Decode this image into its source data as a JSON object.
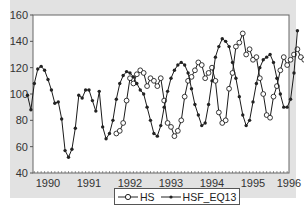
{
  "chart_data": {
    "type": "line",
    "title": "",
    "xlabel": "",
    "ylabel": "",
    "ylim": [
      40,
      160
    ],
    "yticks": [
      40,
      60,
      80,
      100,
      120,
      140,
      160
    ],
    "xticks": [
      "1990",
      "1991",
      "1992",
      "1993",
      "1994",
      "1995",
      "1996"
    ],
    "x_start": "1989-07",
    "frequency": "monthly",
    "grid": false,
    "legend_position": "bottom",
    "series": [
      {
        "name": "HS",
        "marker": "open-circle",
        "values": [
          null,
          null,
          null,
          null,
          null,
          null,
          null,
          null,
          null,
          null,
          null,
          null,
          null,
          null,
          null,
          null,
          null,
          null,
          null,
          null,
          null,
          null,
          null,
          null,
          null,
          null,
          70,
          72,
          78,
          95,
          112,
          108,
          115,
          118,
          116,
          106,
          112,
          110,
          106,
          112,
          95,
          78,
          75,
          68,
          72,
          80,
          98,
          110,
          113,
          118,
          124,
          122,
          112,
          116,
          120,
          110,
          86,
          78,
          80,
          104,
          116,
          136,
          139,
          146,
          130,
          134,
          126,
          128,
          112,
          100,
          84,
          82,
          98,
          106,
          118,
          128,
          122,
          126,
          130,
          134,
          128,
          126,
          110,
          100,
          94,
          92,
          98,
          116,
          148
        ]
      },
      {
        "name": "HSF_EQ13",
        "marker": "filled-dot",
        "values": [
          99,
          88,
          108,
          119,
          121,
          118,
          111,
          103,
          93,
          94,
          81,
          57,
          52,
          58,
          74,
          99,
          97,
          103,
          103,
          95,
          87,
          102,
          75,
          66,
          70,
          80,
          96,
          108,
          114,
          117,
          116,
          113,
          108,
          103,
          100,
          90,
          80,
          70,
          68,
          76,
          90,
          102,
          112,
          118,
          122,
          124,
          122,
          116,
          104,
          92,
          84,
          76,
          78,
          92,
          110,
          128,
          136,
          142,
          140,
          136,
          124,
          112,
          98,
          84,
          76,
          80,
          94,
          108,
          120,
          126,
          128,
          130,
          124,
          112,
          100,
          90,
          90,
          96,
          116,
          148
        ]
      }
    ]
  },
  "legend": {
    "items": [
      {
        "label": "HS",
        "marker": "open-circle"
      },
      {
        "label": "HSF_EQ13",
        "marker": "filled-dot"
      }
    ]
  },
  "colors": {
    "figure_bg": "#e2e2e2",
    "plot_bg": "#ffffff",
    "line": "#1a1a1a"
  }
}
